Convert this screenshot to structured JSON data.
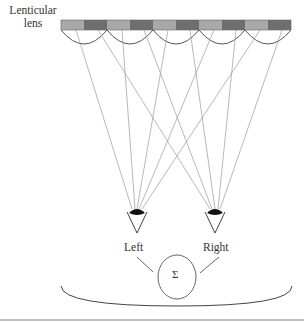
{
  "labels": {
    "lens_line1": "Lenticular",
    "lens_line2": "lens",
    "left_eye": "Left",
    "right_eye": "Right",
    "fusion_symbol": "Σ"
  },
  "colors": {
    "light_segment": "#a8a8a8",
    "dark_segment": "#6e6e6e",
    "line": "#555555",
    "ray": "#9a9a9a"
  },
  "lens_array": {
    "lens_count": 5,
    "segments_per_lens": 2,
    "segment_pattern": [
      "light",
      "dark"
    ]
  },
  "eyes": [
    {
      "name": "Left"
    },
    {
      "name": "Right"
    }
  ]
}
